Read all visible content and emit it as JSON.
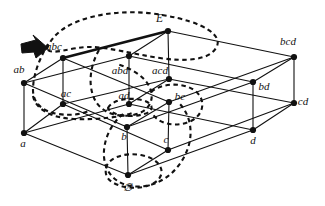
{
  "figure": {
    "kind": "hasse-diagram",
    "background_color": "#ffffff",
    "line_color": "#111111",
    "node_color": "#111111",
    "dashed_color": "#111111",
    "arrow_color": "#111111"
  },
  "nodes": [
    {
      "id": "E",
      "label": "E",
      "x": 168,
      "y": 31,
      "lx": 163,
      "ly": 22,
      "anchor": "end"
    },
    {
      "id": "abc",
      "label": "abc",
      "x": 63,
      "y": 58,
      "lx": 54,
      "ly": 50,
      "anchor": "middle"
    },
    {
      "id": "abd",
      "label": "abd",
      "x": 129,
      "y": 56,
      "lx": 120,
      "ly": 74,
      "anchor": "middle"
    },
    {
      "id": "acd",
      "label": "acd",
      "x": 169,
      "y": 79,
      "lx": 160,
      "ly": 74,
      "anchor": "middle"
    },
    {
      "id": "bcd",
      "label": "bcd",
      "x": 294,
      "y": 57,
      "lx": 288,
      "ly": 45,
      "anchor": "middle"
    },
    {
      "id": "ab",
      "label": "ab",
      "x": 24,
      "y": 83,
      "lx": 19,
      "ly": 73,
      "anchor": "middle"
    },
    {
      "id": "ac",
      "label": "ac",
      "x": 63,
      "y": 104,
      "lx": 66,
      "ly": 97,
      "anchor": "middle"
    },
    {
      "id": "ad",
      "label": "ad",
      "x": 129,
      "y": 104,
      "lx": 124,
      "ly": 99,
      "anchor": "middle"
    },
    {
      "id": "bc",
      "label": "bc",
      "x": 169,
      "y": 102,
      "lx": 180,
      "ly": 100,
      "anchor": "middle"
    },
    {
      "id": "bd",
      "label": "bd",
      "x": 253,
      "y": 82,
      "lx": 264,
      "ly": 90,
      "anchor": "middle"
    },
    {
      "id": "cd",
      "label": "cd",
      "x": 294,
      "y": 103,
      "lx": 303,
      "ly": 105,
      "anchor": "middle"
    },
    {
      "id": "a",
      "label": "a",
      "x": 24,
      "y": 133,
      "lx": 23,
      "ly": 147,
      "anchor": "middle"
    },
    {
      "id": "b",
      "label": "b",
      "x": 127,
      "y": 127,
      "lx": 124,
      "ly": 140,
      "anchor": "middle"
    },
    {
      "id": "c",
      "label": "c",
      "x": 168,
      "y": 150,
      "lx": 166,
      "ly": 143,
      "anchor": "middle"
    },
    {
      "id": "d",
      "label": "d",
      "x": 253,
      "y": 130,
      "lx": 253,
      "ly": 144,
      "anchor": "middle"
    },
    {
      "id": "empty",
      "label": "∅",
      "x": 128,
      "y": 175,
      "lx": 128,
      "ly": 191,
      "anchor": "middle"
    }
  ],
  "edges": [
    {
      "from": "E",
      "to": "abc",
      "bold": true
    },
    {
      "from": "E",
      "to": "abd",
      "bold": false
    },
    {
      "from": "E",
      "to": "acd",
      "bold": false
    },
    {
      "from": "E",
      "to": "bcd",
      "bold": false
    },
    {
      "from": "abc",
      "to": "ab",
      "bold": false
    },
    {
      "from": "abc",
      "to": "ac",
      "bold": false
    },
    {
      "from": "abc",
      "to": "bc",
      "bold": false
    },
    {
      "from": "abd",
      "to": "ab",
      "bold": false
    },
    {
      "from": "abd",
      "to": "ad",
      "bold": false
    },
    {
      "from": "abd",
      "to": "bd",
      "bold": false
    },
    {
      "from": "acd",
      "to": "ac",
      "bold": false
    },
    {
      "from": "acd",
      "to": "ad",
      "bold": false
    },
    {
      "from": "acd",
      "to": "cd",
      "bold": false
    },
    {
      "from": "bcd",
      "to": "bc",
      "bold": false
    },
    {
      "from": "bcd",
      "to": "bd",
      "bold": false
    },
    {
      "from": "bcd",
      "to": "cd",
      "bold": false
    },
    {
      "from": "ab",
      "to": "a",
      "bold": false
    },
    {
      "from": "ab",
      "to": "b",
      "bold": false
    },
    {
      "from": "ac",
      "to": "a",
      "bold": false
    },
    {
      "from": "ac",
      "to": "c",
      "bold": false
    },
    {
      "from": "ad",
      "to": "a",
      "bold": false
    },
    {
      "from": "ad",
      "to": "d",
      "bold": false
    },
    {
      "from": "bc",
      "to": "b",
      "bold": false
    },
    {
      "from": "bc",
      "to": "c",
      "bold": false
    },
    {
      "from": "bd",
      "to": "b",
      "bold": false
    },
    {
      "from": "bd",
      "to": "d",
      "bold": false
    },
    {
      "from": "cd",
      "to": "c",
      "bold": false
    },
    {
      "from": "cd",
      "to": "d",
      "bold": false
    },
    {
      "from": "a",
      "to": "empty",
      "bold": false
    },
    {
      "from": "b",
      "to": "empty",
      "bold": false
    },
    {
      "from": "c",
      "to": "empty",
      "bold": false
    },
    {
      "from": "d",
      "to": "empty",
      "bold": false
    }
  ],
  "dashed_curves": [
    {
      "id": "curve-top-loop",
      "name": "dashed-loop-top",
      "path": "M 47 49 C 58 16, 120 7, 162 15 C 205 22, 224 36, 216 48 C 209 60, 186 62, 160 58 C 132 54, 108 47, 90 47 C 70 47, 52 56, 47 49 Z"
    },
    {
      "id": "curve-left-vertical",
      "name": "dashed-loop-left",
      "path": "M 48 44 C 40 58, 33 74, 33 90 C 33 104, 44 112, 58 114 C 72 116, 84 114, 90 110"
    },
    {
      "id": "curve-ab-band",
      "name": "dashed-band-left-lower",
      "path": "M 33 96 C 36 110, 52 118, 74 119 C 98 120, 120 117, 132 113"
    },
    {
      "id": "curve-mid-vertical",
      "name": "dashed-loop-middle",
      "path": "M 99 50 C 90 66, 88 84, 94 98 C 100 112, 116 118, 133 115 C 149 112, 155 100, 150 88 C 145 76, 130 68, 117 64"
    },
    {
      "id": "curve-ad-small",
      "name": "dashed-oval-ad",
      "path": "M 108 108 C 112 100, 128 97, 142 100 C 154 103, 155 111, 144 114 C 131 118, 112 116, 108 108 Z"
    },
    {
      "id": "curve-bc-right",
      "name": "dashed-loop-bc",
      "path": "M 151 92 C 162 83, 182 82, 194 90 C 206 98, 205 114, 191 121 C 176 128, 158 124, 152 113"
    },
    {
      "id": "curve-bottom-loop",
      "name": "dashed-loop-bottom",
      "path": "M 123 114 C 108 126, 101 147, 105 163 C 109 180, 126 189, 145 186 C 165 183, 181 168, 188 148 C 194 130, 189 112, 178 102"
    },
    {
      "id": "curve-empty-ring",
      "name": "dashed-oval-empty",
      "path": "M 106 168 C 108 158, 124 152, 141 155 C 158 158, 167 170, 158 180 C 148 190, 124 190, 112 182 C 106 178, 105 173, 106 168 Z"
    }
  ],
  "annotations": [
    {
      "id": "arrow-marker",
      "name": "bold-arrow-pointer",
      "points": "21,44 36,40 33,35 48,48 36,58 34,52 22,53",
      "target_node": "abc"
    }
  ]
}
